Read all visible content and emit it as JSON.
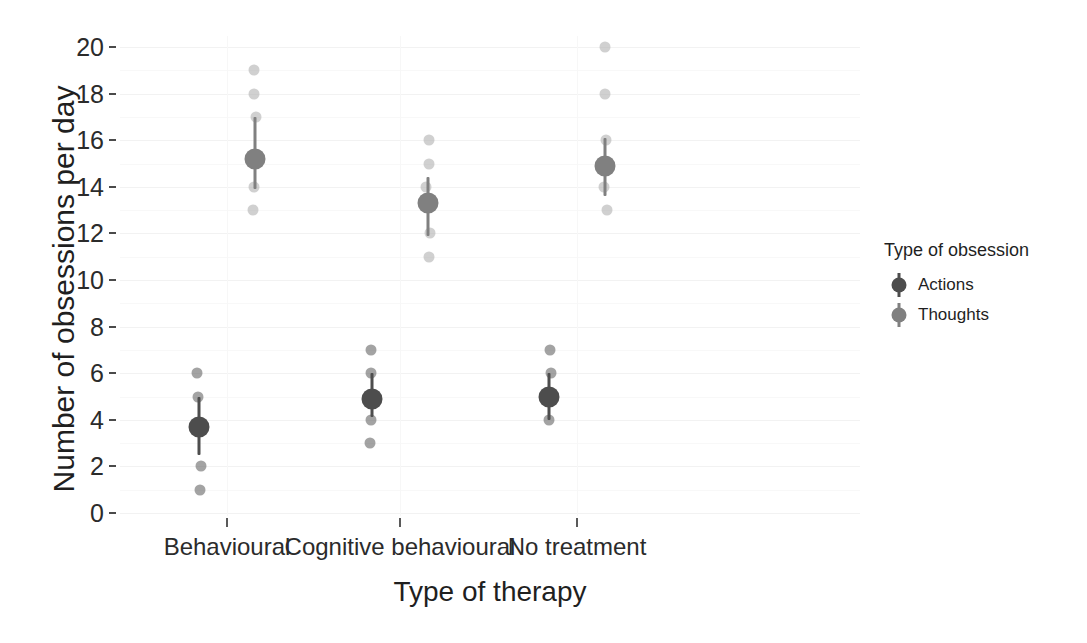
{
  "chart_data": {
    "type": "scatter",
    "title": "",
    "xlabel": "Type of therapy",
    "ylabel": "Number of obsessions per day",
    "categories": [
      "Behavioural",
      "Cognitive behavioural",
      "No treatment"
    ],
    "ylim": [
      0,
      20
    ],
    "yticks": [
      0,
      2,
      4,
      6,
      8,
      10,
      12,
      14,
      16,
      18,
      20
    ],
    "grid": true,
    "legend": {
      "title": "Type of obsession",
      "position": "right",
      "entries": [
        {
          "name": "Actions",
          "color": "#4d4d4d"
        },
        {
          "name": "Thoughts",
          "color": "#808080"
        }
      ]
    },
    "series": [
      {
        "name": "Actions",
        "color": "#4d4d4d",
        "raw_color": "#6b6b6b",
        "dodge": -0.16,
        "groups": [
          {
            "category": "Behavioural",
            "mean": 3.7,
            "ci_low": 2.5,
            "ci_high": 5.0,
            "points": [
              6,
              5,
              2,
              1
            ]
          },
          {
            "category": "Cognitive behavioural",
            "mean": 4.9,
            "ci_low": 4.1,
            "ci_high": 6.0,
            "points": [
              7,
              6,
              4,
              3
            ]
          },
          {
            "category": "No treatment",
            "mean": 5.0,
            "ci_low": 4.0,
            "ci_high": 6.0,
            "points": [
              7,
              6,
              4
            ]
          }
        ]
      },
      {
        "name": "Thoughts",
        "color": "#808080",
        "raw_color": "#b3b3b3",
        "dodge": 0.16,
        "groups": [
          {
            "category": "Behavioural",
            "mean": 15.2,
            "ci_low": 13.9,
            "ci_high": 17.0,
            "points": [
              19,
              18,
              17,
              14,
              13
            ]
          },
          {
            "category": "Cognitive behavioural",
            "mean": 13.3,
            "ci_low": 11.9,
            "ci_high": 14.4,
            "points": [
              16,
              15,
              14,
              12,
              11
            ]
          },
          {
            "category": "No treatment",
            "mean": 14.9,
            "ci_low": 13.6,
            "ci_high": 16.1,
            "points": [
              20,
              18,
              16,
              14,
              13
            ]
          }
        ]
      }
    ]
  },
  "axis": {
    "y_title": "Number of obsessions per day",
    "x_title": "Type of therapy",
    "y_tick_labels": [
      "0",
      "2",
      "4",
      "6",
      "8",
      "10",
      "12",
      "14",
      "16",
      "18",
      "20"
    ],
    "x_tick_labels": [
      "Behavioural",
      "Cognitive behavioural",
      "No treatment"
    ]
  },
  "legend": {
    "title": "Type of obsession",
    "items": [
      "Actions",
      "Thoughts"
    ]
  },
  "colors": {
    "actions": "#4d4d4d",
    "thoughts": "#808080",
    "actions_raw": "#6b6b6b",
    "thoughts_raw": "#b3b3b3",
    "grid_major": "#f2f2f2",
    "grid_minor": "#f8f8f8",
    "background": "#ffffff",
    "text": "#1f1f1f"
  }
}
